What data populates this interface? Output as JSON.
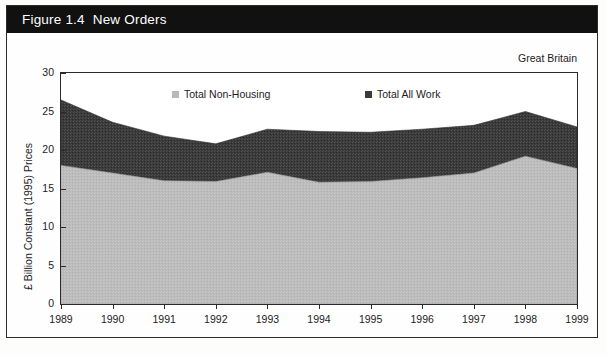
{
  "figure": {
    "title": "Figure 1.4  New Orders",
    "region_label": "Great Britain",
    "banner_color": "#111111",
    "banner_text_color": "#ffffff"
  },
  "legend": {
    "position": "top-inside",
    "items": [
      {
        "label": "Total Non-Housing",
        "color": "#b9b9b9",
        "marker": "square"
      },
      {
        "label": "Total All Work",
        "color": "#3a3a3a",
        "marker": "square"
      }
    ]
  },
  "axes": {
    "y_title": "£ Billion Constant (1995) Prices",
    "y_ticks": [
      "0",
      "5",
      "10",
      "15",
      "20",
      "25",
      "30"
    ],
    "x_ticks": [
      "1989",
      "1990",
      "1991",
      "1992",
      "1993",
      "1994",
      "1995",
      "1996",
      "1997",
      "1998",
      "1999"
    ]
  },
  "chart_data": {
    "type": "area",
    "title": "Figure 1.4  New Orders",
    "subtitle": "Great Britain",
    "xlabel": "",
    "ylabel": "£ Billion Constant (1995) Prices",
    "ylim": [
      0,
      30
    ],
    "grid": false,
    "legend_position": "top-inside",
    "stacked": false,
    "categories": [
      "1989",
      "1990",
      "1991",
      "1992",
      "1993",
      "1994",
      "1995",
      "1996",
      "1997",
      "1998",
      "1999"
    ],
    "series": [
      {
        "name": "Total All Work",
        "color": "#3a3a3a",
        "values": [
          26.5,
          23.6,
          21.8,
          20.8,
          22.7,
          22.4,
          22.3,
          22.7,
          23.2,
          25.0,
          23.0
        ]
      },
      {
        "name": "Total Non-Housing",
        "color": "#b9b9b9",
        "values": [
          18.0,
          17.0,
          16.0,
          15.9,
          17.1,
          15.8,
          15.9,
          16.4,
          17.0,
          19.2,
          17.6
        ]
      }
    ]
  }
}
